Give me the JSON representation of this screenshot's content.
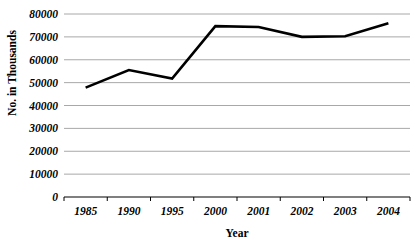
{
  "chart_data": {
    "type": "line",
    "title": "",
    "xlabel": "Year",
    "ylabel": "No. in Thousands",
    "categories": [
      "1985",
      "1990",
      "1995",
      "2000",
      "2001",
      "2002",
      "2003",
      "2004"
    ],
    "values": [
      47800,
      55500,
      51800,
      74700,
      74300,
      70000,
      70300,
      76000
    ],
    "series": [
      {
        "name": "No. in Thousands",
        "values": [
          47800,
          55500,
          51800,
          74700,
          74300,
          70000,
          70300,
          76000
        ]
      }
    ],
    "ylim": [
      0,
      80000
    ],
    "xlim_categories": 8,
    "yticks": [
      0,
      10000,
      20000,
      30000,
      40000,
      50000,
      60000,
      70000,
      80000
    ],
    "ytick_labels": [
      "0",
      "10000",
      "20000",
      "30000",
      "40000",
      "50000",
      "60000",
      "70000",
      "80000"
    ],
    "xtick_labels": [
      "1985",
      "1990",
      "1995",
      "2000",
      "2001",
      "2002",
      "2003",
      "2004"
    ],
    "grid": true,
    "grid_axis": "y",
    "legend": false,
    "legend_position": "none",
    "line_color": "#000000",
    "grid_color": "#a8a8a8",
    "axis_color": "#000000",
    "background_color": "#ffffff",
    "annotations": []
  },
  "axis": {
    "y_title": "No. in Thousands",
    "x_title": "Year"
  }
}
